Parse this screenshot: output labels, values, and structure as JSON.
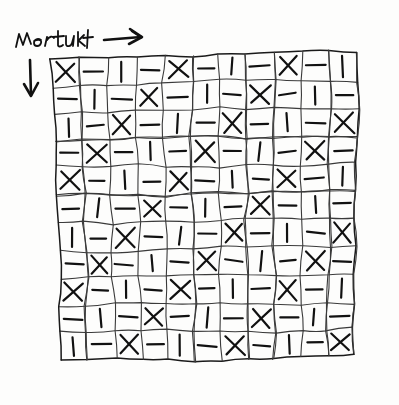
{
  "page": {
    "medium": "pencil on paper",
    "background_color": "#fdfdfc",
    "ink_color": "#1a1a1a",
    "width": 399,
    "height": 405
  },
  "annotation": {
    "handwritten_label": "Wertukt",
    "label_position": "top-left",
    "arrow_right": "→",
    "arrow_right_name": "horizontal-direction-arrow",
    "arrow_down": "↓",
    "arrow_down_name": "vertical-direction-arrow"
  },
  "grid": {
    "rows": 11,
    "columns": 11,
    "total_cells": 121,
    "style": "freehand wobbly ruled lines",
    "glyph_set": [
      "X",
      "-",
      "|"
    ],
    "glyph_cycle_length": 3,
    "description": "Each row shifts the X / - / | cycle by one position relative to the row above, producing diagonal bands of identical marks.",
    "cells": [
      [
        "X",
        "-",
        "|",
        "-",
        "X",
        "-",
        "|",
        "-",
        "X",
        "-",
        "|"
      ],
      [
        "-",
        "|",
        "-",
        "X",
        "-",
        "|",
        "-",
        "X",
        "-",
        "|",
        "-"
      ],
      [
        "|",
        "-",
        "X",
        "-",
        "|",
        "-",
        "X",
        "-",
        "|",
        "-",
        "X"
      ],
      [
        "-",
        "X",
        "-",
        "|",
        "-",
        "X",
        "-",
        "|",
        "-",
        "X",
        "-"
      ],
      [
        "X",
        "-",
        "|",
        "-",
        "X",
        "-",
        "|",
        "-",
        "X",
        "-",
        "|"
      ],
      [
        "-",
        "|",
        "-",
        "X",
        "-",
        "|",
        "-",
        "X",
        "-",
        "|",
        "-"
      ],
      [
        "|",
        "-",
        "X",
        "-",
        "|",
        "-",
        "X",
        "-",
        "|",
        "-",
        "X"
      ],
      [
        "-",
        "X",
        "-",
        "|",
        "-",
        "X",
        "-",
        "|",
        "-",
        "X",
        "-"
      ],
      [
        "X",
        "-",
        "|",
        "-",
        "X",
        "-",
        "|",
        "-",
        "X",
        "-",
        "|"
      ],
      [
        "-",
        "|",
        "-",
        "X",
        "-",
        "|",
        "-",
        "X",
        "-",
        "|",
        "-"
      ],
      [
        "|",
        "-",
        "X",
        "-",
        "|",
        "-",
        "X",
        "-",
        "|",
        "-",
        "X"
      ]
    ],
    "counts": {
      "X": 40,
      "dash": 41,
      "bar": 40
    }
  }
}
